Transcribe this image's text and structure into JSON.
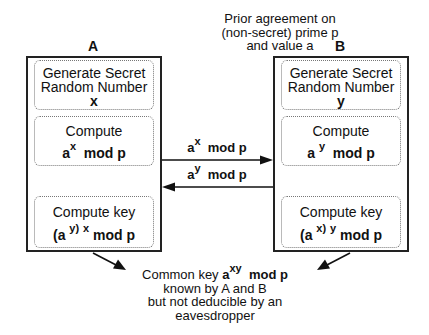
{
  "agreement_note": [
    "Prior agreement on",
    "(non-secret) prime p",
    "and value a"
  ],
  "party_a": {
    "label": "A",
    "steps": [
      {
        "title_lines": [
          "Generate Secret",
          "Random Number"
        ],
        "value": "x"
      },
      {
        "title": "Compute",
        "expr_base": "a",
        "expr_exp": "x",
        "expr_tail": "mod p"
      },
      {
        "title": "Compute key",
        "expr_open": "(a",
        "expr_inner_exp": "y)",
        "expr_outer_exp": "x",
        "expr_tail": "mod p"
      }
    ]
  },
  "party_b": {
    "label": "B",
    "steps": [
      {
        "title_lines": [
          "Generate Secret",
          "Random Number"
        ],
        "value": "y"
      },
      {
        "title": "Compute",
        "expr_base": "a",
        "expr_exp": "y",
        "expr_tail": "mod p"
      },
      {
        "title": "Compute key",
        "expr_open": "(a",
        "expr_inner_exp": "x)",
        "expr_outer_exp": "y",
        "expr_tail": "mod p"
      }
    ]
  },
  "messages": [
    {
      "direction": "A-to-B",
      "base": "a",
      "exp": "x",
      "tail": "mod p"
    },
    {
      "direction": "B-to-A",
      "base": "a",
      "exp": "y",
      "tail": "mod p"
    }
  ],
  "result_note": {
    "prefix": "Common key",
    "base": "a",
    "exp": "xy",
    "tail": "mod p",
    "lines": [
      "known by A and B",
      "but not deducible by an",
      "eavesdropper"
    ]
  }
}
